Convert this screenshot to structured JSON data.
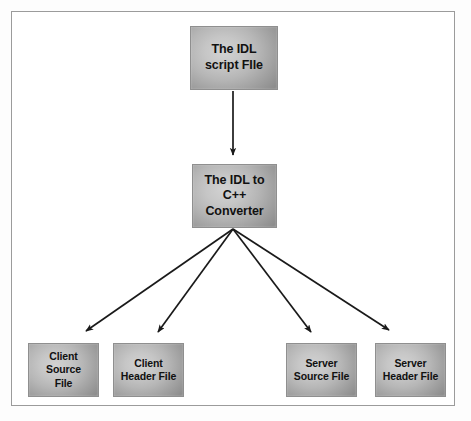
{
  "figure": {
    "type": "flow-diagram",
    "frame_border_color": "#9b9b9b",
    "background_color": "#ffffff",
    "node_fill_light": "#d2d2d2",
    "node_fill_dark": "#8d8d8d",
    "arrow_color": "#1a1a1a"
  },
  "nodes": {
    "idl_script": {
      "label": "The IDL\nscript FIle",
      "id": "idl-script-file"
    },
    "idl_converter": {
      "label": "The IDL to\nC++ Converter",
      "id": "idl-to-cpp-converter"
    },
    "client_source": {
      "label": "Client Source\nFile",
      "id": "client-source-file"
    },
    "client_header": {
      "label": "Client\nHeader File",
      "id": "client-header-file"
    },
    "server_source": {
      "label": "Server\nSource File",
      "id": "server-source-file"
    },
    "server_header": {
      "label": "Server\nHeader File",
      "id": "server-header-file"
    }
  },
  "edges": [
    {
      "from": "idl_script",
      "to": "idl_converter",
      "name": "arrow-script-to-converter"
    },
    {
      "from": "idl_converter",
      "to": "client_source",
      "name": "arrow-converter-to-client-source"
    },
    {
      "from": "idl_converter",
      "to": "client_header",
      "name": "arrow-converter-to-client-header"
    },
    {
      "from": "idl_converter",
      "to": "server_source",
      "name": "arrow-converter-to-server-source"
    },
    {
      "from": "idl_converter",
      "to": "server_header",
      "name": "arrow-converter-to-server-header"
    }
  ]
}
